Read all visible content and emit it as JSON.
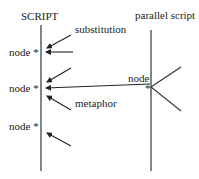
{
  "diagram": {
    "left_title": "SCRIPT",
    "right_title": "parallel script",
    "labels": {
      "substitution": "substitution",
      "metaphor": "metaphor",
      "node_right": "node",
      "node_right_star": "*"
    },
    "left_nodes": [
      {
        "label": "node *"
      },
      {
        "label": "node *"
      },
      {
        "label": "node *"
      }
    ],
    "colors": {
      "line": "#333333",
      "text": "#222222",
      "background": "#ffffff"
    }
  }
}
